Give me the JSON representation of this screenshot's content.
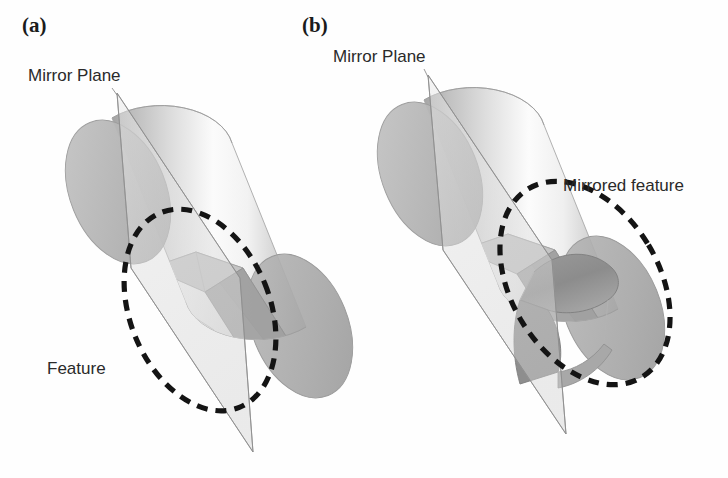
{
  "figure": {
    "background_color": "#fefefe",
    "panels": [
      {
        "tag": "(a)",
        "tag_x": 22,
        "tag_y": 32,
        "mirror_plane_label": "Mirror Plane",
        "mirror_plane_label_x": 28,
        "mirror_plane_label_y": 81,
        "feature_label": "Feature",
        "feature_label_x": 47,
        "feature_label_y": 374,
        "description": "Transparent cylinder with an internal keyway slot feature, intersected by a translucent mirror plane; the slot feature is circled with a dashed ellipse."
      },
      {
        "tag": "(b)",
        "tag_x": 302,
        "tag_y": 32,
        "mirror_plane_label": "Mirror Plane",
        "mirror_plane_label_x": 333,
        "mirror_plane_label_y": 62,
        "feature_label": "Mirrored feature",
        "feature_label_x": 563,
        "feature_label_y": 191,
        "description": "Same cylinder after mirroring the slot feature across the mirror plane; the mirrored protruding flange is circled with a dashed ellipse."
      }
    ],
    "colors": {
      "cylinder_body_light": "#fdfdfd",
      "cylinder_body_mid": "#d8d8d8",
      "cylinder_body_dark": "#a9a9a9",
      "cylinder_cap": "#b6b6b6",
      "cylinder_cap_dark": "#9c9c9c",
      "mirror_plane_fill": "#dcdcdc",
      "mirror_plane_stroke": "#9a9a9a",
      "feature_shadow": "#8a8a8a",
      "annotation_dash": "#141414",
      "text": "#2a2a2a",
      "panel_tag": "#1b1b1b"
    },
    "annotations": {
      "dash_pattern": "11 8",
      "dash_stroke_width": 5.2,
      "panel_a_ellipse": {
        "cx": 200,
        "cy": 310,
        "rx": 70,
        "ry": 105,
        "rotation": -22
      },
      "panel_b_ellipse": {
        "cx": 585,
        "cy": 283,
        "rx": 74,
        "ry": 110,
        "rotation": -31
      }
    }
  }
}
